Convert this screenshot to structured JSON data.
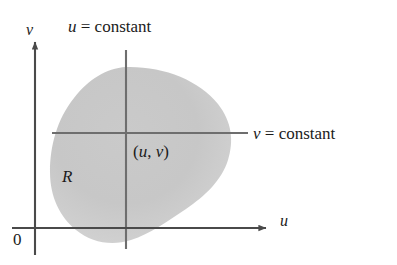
{
  "figure": {
    "kind": "coordinate-plane-region-diagram",
    "background_color": "#ffffff"
  },
  "labels": {
    "u_constant": {
      "variable": "u",
      "relation": " = ",
      "value": "constant"
    },
    "v_constant": {
      "variable": "v",
      "relation": " = ",
      "value": "constant"
    },
    "point": {
      "open": "(",
      "u": "u",
      "comma": ", ",
      "v": "v",
      "close": ")"
    },
    "region": "R",
    "axis_vertical": "v",
    "axis_horizontal": "u",
    "origin": "0"
  },
  "colors": {
    "region_fill": "#c6c6c6",
    "region_fill_light": "#d2d2d2",
    "axis_line": "#4a4a4a",
    "constant_line": "#6e6e6e",
    "text": "#1b1b1b"
  },
  "geometry": {
    "v_axis_x": 35,
    "u_axis_y": 228,
    "u_axis_end_x": 268,
    "v_axis_top_y": 40,
    "constant_lines_intersection": {
      "x": 126,
      "y": 133
    },
    "u_constant_line": {
      "x": 126,
      "y_top": 50,
      "y_bottom": 249
    },
    "v_constant_line": {
      "y": 133,
      "x_left": 52,
      "x_right": 248
    },
    "region_extents": {
      "left_x": 50,
      "right_x": 233,
      "top_y": 67,
      "bottom_y": 243
    }
  }
}
